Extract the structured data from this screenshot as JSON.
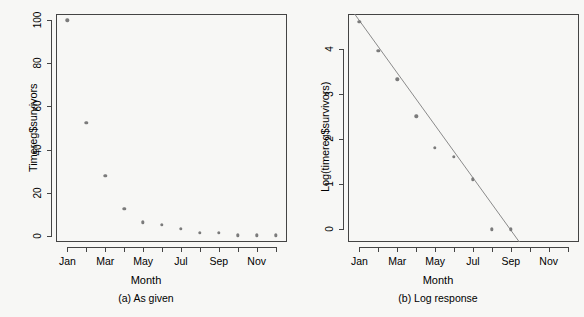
{
  "figure": {
    "background": "#f7f7f5",
    "marker_color": "#7b7b7b",
    "line_color": "#8a8a8a",
    "axis_color": "#444444"
  },
  "panels": [
    {
      "id": "panel-a",
      "caption": "(a) As given",
      "xlabel": "Month",
      "ylabel": "Timereg$survivors"
    },
    {
      "id": "panel-b",
      "caption": "(b) Log response",
      "xlabel": "Month",
      "ylabel": "Log(timereg$survivors)"
    }
  ],
  "chart_data": [
    {
      "type": "scatter",
      "title": "(a) As given",
      "xlabel": "Month",
      "ylabel": "Timereg$survivors",
      "xlim": [
        0.4,
        12.6
      ],
      "ylim": [
        -3,
        103
      ],
      "grid": false,
      "legend": "none",
      "xtick_values": [
        1,
        3,
        5,
        7,
        9,
        11
      ],
      "xtick_labels": [
        "Jan",
        "Mar",
        "May",
        "Jul",
        "Sep",
        "Nov"
      ],
      "xminor_values": [
        2,
        4,
        6,
        8,
        10,
        12
      ],
      "ytick_values": [
        0,
        20,
        40,
        60,
        80,
        100
      ],
      "ytick_labels": [
        "0",
        "20",
        "40",
        "60",
        "80",
        "100"
      ],
      "x": [
        1,
        2,
        3,
        4,
        5,
        6,
        7,
        8,
        9,
        10,
        11,
        12
      ],
      "values": [
        100,
        52.3,
        27.8,
        12.3,
        6.1,
        5.0,
        3.2,
        1.3,
        1.2,
        0.2,
        0.2,
        0.2
      ]
    },
    {
      "type": "scatter",
      "title": "(b) Log response",
      "xlabel": "Month",
      "ylabel": "Log(timereg$survivors)",
      "xlim": [
        0.4,
        12.6
      ],
      "ylim": [
        -0.28,
        4.78
      ],
      "grid": false,
      "legend": "none",
      "xtick_values": [
        1,
        3,
        5,
        7,
        9,
        11
      ],
      "xtick_labels": [
        "Jan",
        "Mar",
        "May",
        "Jul",
        "Sep",
        "Nov"
      ],
      "xminor_values": [
        2,
        4,
        6,
        8,
        10,
        12
      ],
      "ytick_values": [
        0,
        1,
        2,
        3,
        4
      ],
      "ytick_labels": [
        "0",
        "1",
        "2",
        "3",
        "4"
      ],
      "x": [
        1,
        2,
        3,
        4,
        5,
        6,
        7,
        8,
        9
      ],
      "values": [
        4.61,
        3.96,
        3.33,
        2.51,
        1.81,
        1.61,
        1.11,
        0.0,
        0.0
      ],
      "series": [
        {
          "name": "fitted regression line",
          "type": "line",
          "x": [
            0.75,
            9.45
          ],
          "values": [
            4.78,
            -0.28
          ]
        }
      ]
    }
  ]
}
